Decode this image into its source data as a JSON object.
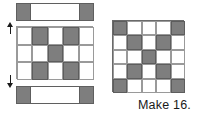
{
  "figure": {
    "type": "quilt-block-assembly-diagram",
    "caption": "Make 16.",
    "colors": {
      "fabric_dark": "#7e7e7e",
      "fabric_light": "#ffffff",
      "outline": "#5d5d5d",
      "background": "#ffffff",
      "text": "#1a1a1a"
    },
    "left_exploded_view": {
      "top_strip": {
        "label": "top sashing strip",
        "segments": [
          "dark",
          "light",
          "dark"
        ]
      },
      "center_unit": {
        "label": "center nine-patch unit",
        "grid": [
          [
            "light",
            "dark",
            "light",
            "dark",
            "light"
          ],
          [
            "light",
            "light",
            "dark",
            "light",
            "light"
          ],
          [
            "light",
            "dark",
            "light",
            "dark",
            "light"
          ]
        ]
      },
      "bottom_strip": {
        "label": "bottom sashing strip",
        "segments": [
          "dark",
          "light",
          "dark"
        ]
      },
      "arrows": [
        {
          "name": "join-arrow-up",
          "direction": "up"
        },
        {
          "name": "join-arrow-down",
          "direction": "down"
        }
      ]
    },
    "right_assembled_block": {
      "label": "assembled block",
      "rows": 5,
      "cols": 5,
      "grid": [
        [
          "dark",
          "light",
          "light",
          "light",
          "dark"
        ],
        [
          "light",
          "dark",
          "light",
          "dark",
          "light"
        ],
        [
          "light",
          "light",
          "dark",
          "light",
          "light"
        ],
        [
          "light",
          "dark",
          "light",
          "dark",
          "light"
        ],
        [
          "dark",
          "light",
          "light",
          "light",
          "dark"
        ]
      ]
    }
  }
}
